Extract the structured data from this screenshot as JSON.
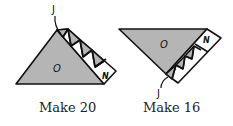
{
  "colors": {
    "shade": "#b5b5b5",
    "stroke": "#111111",
    "background": "#ffffff"
  },
  "figures": [
    {
      "id": "left",
      "caption": "Make 20",
      "labels": {
        "large_triangle": "O",
        "strip_end_square": "N",
        "strip_start": "J"
      }
    },
    {
      "id": "right",
      "caption": "Make 16",
      "labels": {
        "large_triangle": "O",
        "strip_end_square": "N",
        "strip_start": "J"
      }
    }
  ]
}
